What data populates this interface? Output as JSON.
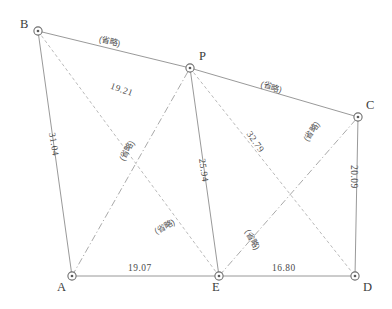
{
  "diagram": {
    "type": "survey-network-triangulation",
    "canvas": {
      "width": 392,
      "height": 309
    },
    "stations": [
      {
        "id": "B",
        "label": "B",
        "x": 38,
        "y": 31,
        "label_x": 20,
        "label_y": 18
      },
      {
        "id": "P",
        "label": "P",
        "x": 190,
        "y": 68,
        "label_x": 199,
        "label_y": 50
      },
      {
        "id": "C",
        "label": "C",
        "x": 358,
        "y": 117,
        "label_x": 366,
        "label_y": 99
      },
      {
        "id": "A",
        "label": "A",
        "x": 72,
        "y": 276,
        "label_x": 57,
        "label_y": 281
      },
      {
        "id": "E",
        "label": "E",
        "x": 219,
        "y": 276,
        "label_x": 212,
        "label_y": 281
      },
      {
        "id": "D",
        "label": "D",
        "x": 355,
        "y": 276,
        "label_x": 363,
        "label_y": 281
      }
    ],
    "edges": [
      {
        "from": "B",
        "to": "P",
        "style": "solid",
        "measured": false
      },
      {
        "from": "P",
        "to": "C",
        "style": "solid",
        "measured": false
      },
      {
        "from": "B",
        "to": "A",
        "style": "solid",
        "measured": true
      },
      {
        "from": "C",
        "to": "D",
        "style": "solid",
        "measured": true
      },
      {
        "from": "P",
        "to": "E",
        "style": "solid",
        "measured": true
      },
      {
        "from": "A",
        "to": "E",
        "style": "solid",
        "measured": true
      },
      {
        "from": "E",
        "to": "D",
        "style": "solid",
        "measured": true
      },
      {
        "from": "B",
        "to": "E",
        "style": "dashed",
        "measured": true
      },
      {
        "from": "P",
        "to": "D",
        "style": "dashed",
        "measured": true
      },
      {
        "from": "A",
        "to": "P",
        "style": "dashdot",
        "measured": false
      },
      {
        "from": "E",
        "to": "C",
        "style": "dashdot",
        "measured": false
      }
    ],
    "distance_labels": [
      {
        "name": "distance-B-E",
        "edge": "B-E",
        "value": "19.21",
        "x": 112,
        "y": 82,
        "rotate": 19
      },
      {
        "name": "distance-B-A",
        "edge": "B-A",
        "value": "31.04",
        "x": 56,
        "y": 132,
        "rotate": 81
      },
      {
        "name": "distance-P-E",
        "edge": "P-E",
        "value": "25.94",
        "x": 206,
        "y": 158,
        "rotate": 82
      },
      {
        "name": "distance-P-D",
        "edge": "P-D",
        "value": "32.79",
        "x": 252,
        "y": 130,
        "rotate": 55
      },
      {
        "name": "distance-C-D",
        "edge": "C-D",
        "value": "20.09",
        "x": 358,
        "y": 165,
        "rotate": 90
      },
      {
        "name": "distance-A-E",
        "edge": "A-E",
        "value": "19.07",
        "x": 128,
        "y": 264,
        "rotate": 0
      },
      {
        "name": "distance-E-D",
        "edge": "E-D",
        "value": "16.80",
        "x": 272,
        "y": 264,
        "rotate": 0
      }
    ],
    "omitted_labels": [
      {
        "name": "omitted-label-B-P",
        "edge": "B-P",
        "text": "(省略)",
        "x": 100,
        "y": 35,
        "rotate": 13
      },
      {
        "name": "omitted-label-P-C",
        "edge": "P-C",
        "text": "(省略)",
        "x": 262,
        "y": 80,
        "rotate": 16
      },
      {
        "name": "omitted-label-A-P",
        "edge": "A-P",
        "text": "(省略)",
        "x": 118,
        "y": 158,
        "rotate": 300
      },
      {
        "name": "omitted-label-E-C",
        "edge": "E-C",
        "text": "(省略)",
        "x": 302,
        "y": 138,
        "rotate": 305
      },
      {
        "name": "omitted-label-A-E-P",
        "edge": "A-E-diagonal",
        "text": "(省略)",
        "x": 153,
        "y": 228,
        "rotate": 332
      },
      {
        "name": "omitted-label-E-D-P",
        "edge": "E-D-diagonal",
        "text": "(省略)",
        "x": 251,
        "y": 228,
        "rotate": 62
      }
    ]
  }
}
